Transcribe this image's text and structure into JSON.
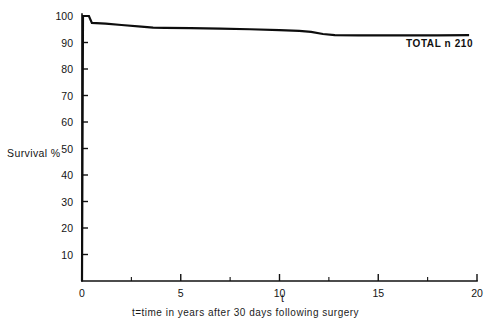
{
  "figure": {
    "ylabel": "Survival  %",
    "xaxis_name": "t",
    "caption": "t=time in years after 30 days following surgery",
    "footnote": ""
  },
  "chart_data": {
    "type": "line",
    "title": "",
    "xlabel": "t=time in years after 30 days following surgery",
    "ylabel": "Survival  %",
    "xlim": [
      0,
      20
    ],
    "ylim": [
      0,
      100
    ],
    "xticks": [
      0,
      5,
      10,
      15,
      20
    ],
    "xtick_labels": [
      "0",
      "5",
      "10",
      "15",
      "20"
    ],
    "xticks_minor": [
      2.5,
      7.5,
      12.5,
      17.5
    ],
    "yticks": [
      10,
      20,
      30,
      40,
      50,
      60,
      70,
      80,
      90,
      100
    ],
    "ytick_labels": [
      "10",
      "20",
      "30",
      "40",
      "50",
      "60",
      "70",
      "80",
      "90",
      "100"
    ],
    "grid": false,
    "legend": "none",
    "line_color": "#0d0d0d",
    "series": [
      {
        "name": "TOTAL",
        "annotation": "TOTAL  n  210",
        "n": 210,
        "x": [
          0.0,
          0.05,
          0.35,
          0.5,
          1.2,
          2.0,
          3.0,
          3.6,
          4.2,
          5.5,
          7.0,
          8.5,
          10.0,
          11.0,
          11.6,
          12.2,
          12.8,
          14.0,
          16.0,
          18.0,
          19.6
        ],
        "y": [
          0.0,
          100.0,
          100.0,
          97.4,
          97.1,
          96.6,
          96.0,
          95.6,
          95.5,
          95.4,
          95.2,
          95.0,
          94.7,
          94.4,
          94.0,
          93.2,
          92.8,
          92.7,
          92.7,
          92.7,
          92.8
        ]
      }
    ]
  }
}
